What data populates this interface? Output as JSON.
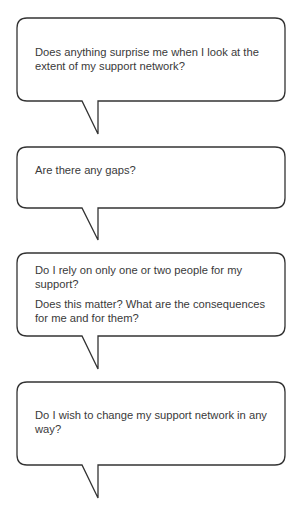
{
  "bubbles": [
    {
      "paragraphs": [
        "Does anything surprise me when I look at the extent of my support network?"
      ]
    },
    {
      "paragraphs": [
        "Are there any gaps?"
      ]
    },
    {
      "paragraphs": [
        "Do I rely on only one or two people for my support?",
        "Does this matter? What are the consequences for me and for them?"
      ]
    },
    {
      "paragraphs": [
        "Do I wish to change my support network in any way?"
      ]
    }
  ],
  "colors": {
    "outline": "#333333",
    "text": "#3a3a3a",
    "fill": "#ffffff"
  }
}
